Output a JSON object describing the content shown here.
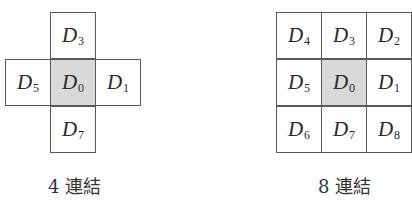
{
  "diagrams": {
    "four": {
      "caption": "4 連結",
      "cells": {
        "top": {
          "letter": "D",
          "sub": "3"
        },
        "left": {
          "letter": "D",
          "sub": "5"
        },
        "center": {
          "letter": "D",
          "sub": "0"
        },
        "right": {
          "letter": "D",
          "sub": "1"
        },
        "bottom": {
          "letter": "D",
          "sub": "7"
        }
      }
    },
    "eight": {
      "caption": "8 連結",
      "cells": {
        "top_left": {
          "letter": "D",
          "sub": "4"
        },
        "top": {
          "letter": "D",
          "sub": "3"
        },
        "top_right": {
          "letter": "D",
          "sub": "2"
        },
        "left": {
          "letter": "D",
          "sub": "5"
        },
        "center": {
          "letter": "D",
          "sub": "0"
        },
        "right": {
          "letter": "D",
          "sub": "1"
        },
        "bottom_left": {
          "letter": "D",
          "sub": "6"
        },
        "bottom": {
          "letter": "D",
          "sub": "7"
        },
        "bottom_right": {
          "letter": "D",
          "sub": "8"
        }
      }
    }
  },
  "colors": {
    "grid_line": "#5a5a5a",
    "center_fill": "#d9d9d9",
    "text": "#2a2a2a"
  }
}
